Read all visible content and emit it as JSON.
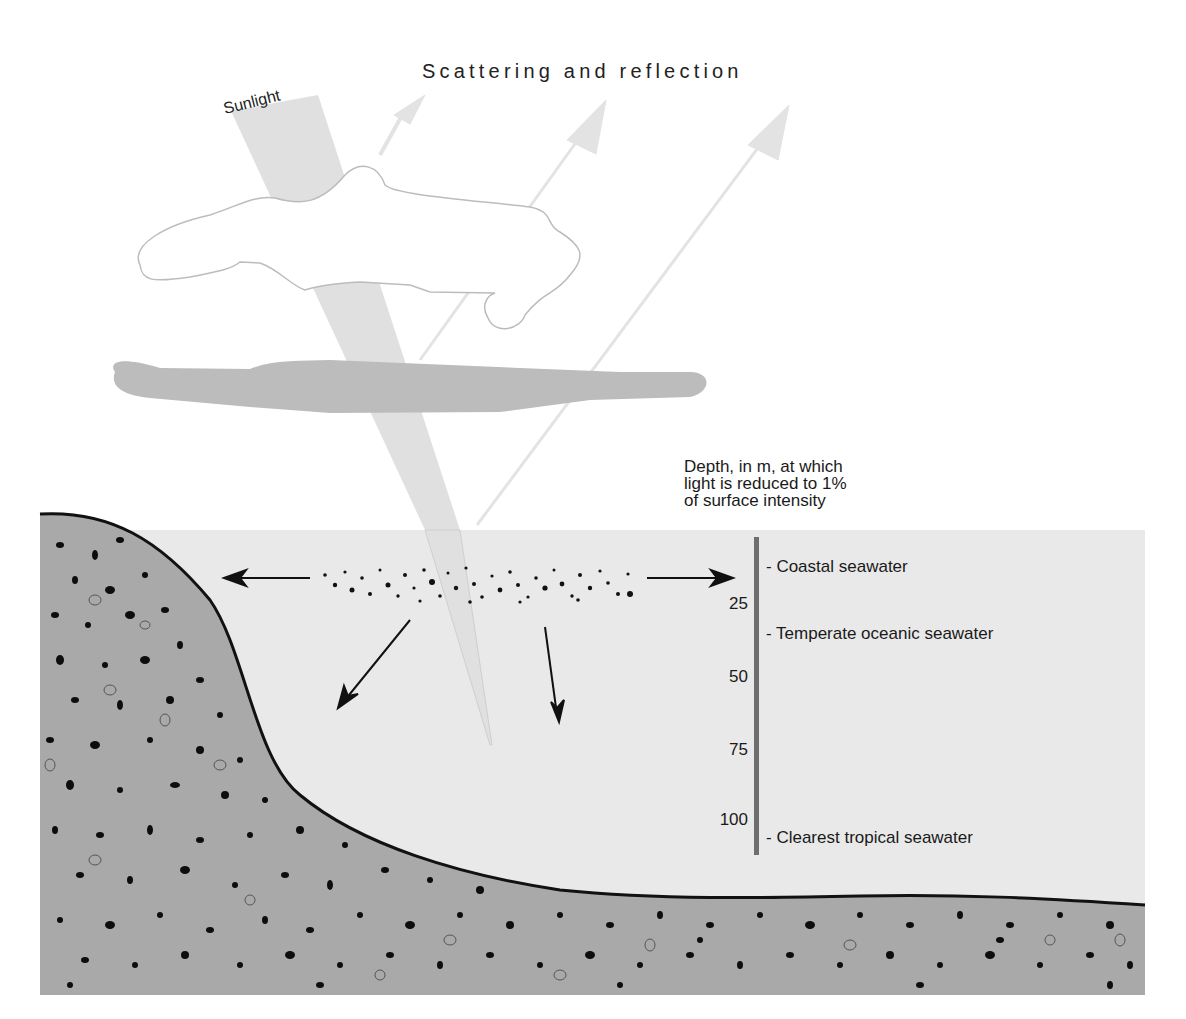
{
  "title": "Scattering and reflection",
  "sunlight_label": "Sunlight",
  "depth_scale": {
    "heading_lines": [
      "Depth, in m, at which",
      "light is reduced to 1%",
      "of surface intensity"
    ],
    "ticks": [
      "25",
      "50",
      "75",
      "100"
    ],
    "water_types": [
      {
        "label": "- Coastal seawater",
        "depth_m": 20
      },
      {
        "label": "- Temperate oceanic seawater",
        "depth_m": 35
      },
      {
        "label": "- Clearest tropical seawater",
        "depth_m": 105
      }
    ]
  },
  "colors": {
    "water": "#e9e9e9",
    "sediment": "#a9a9a9",
    "seabed_line": "#111111",
    "depth_bar": "#6e6e6e",
    "light_beam": "#dcdcdc",
    "reflection_arrows": "#e2e2e2",
    "haze_layer": "#bdbdbd",
    "cloud_outline": "#bbbbbb"
  }
}
